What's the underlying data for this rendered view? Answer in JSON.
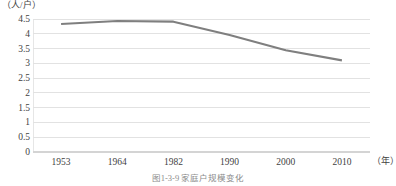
{
  "figure": {
    "caption": "图1-3-9  家庭户规模变化",
    "y_unit_label": "（人/户）",
    "x_unit_label": "（年）"
  },
  "chart_data": {
    "type": "line",
    "title": "",
    "subtitle": "",
    "xlabel": "（年）",
    "ylabel": "（人/户）",
    "categories": [
      "1953",
      "1964",
      "1982",
      "1990",
      "2000",
      "2010"
    ],
    "series": [
      {
        "name": "家庭户规模",
        "values": [
          4.33,
          4.43,
          4.41,
          3.96,
          3.44,
          3.1
        ],
        "color": "#7f7f7f"
      }
    ],
    "ylim": [
      0,
      4.5
    ],
    "yticks": [
      "0",
      "0.5",
      "1",
      "1.5",
      "2",
      "2.5",
      "3",
      "3.5",
      "4",
      "4.5"
    ],
    "ytick_values": [
      0,
      0.5,
      1,
      1.5,
      2,
      2.5,
      3,
      3.5,
      4,
      4.5
    ],
    "grid": true,
    "grid_color": "#e2e2e2",
    "legend": "none",
    "legend_position": "none",
    "annotations": []
  }
}
